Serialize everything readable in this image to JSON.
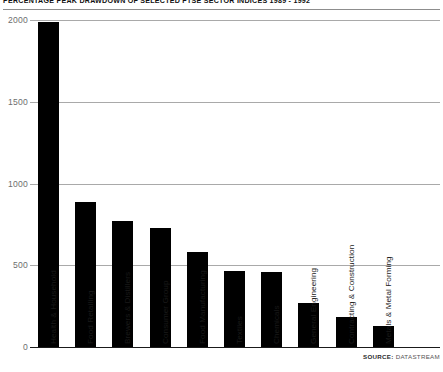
{
  "chart_data": {
    "type": "bar",
    "title": "PERCENTAGE PEAK DRAWDOWN OF SELECTED FTSE SECTOR INDICES 1989 - 1992",
    "xlabel": "",
    "ylabel": "",
    "ylim": [
      0,
      2000
    ],
    "yticks": [
      0,
      500,
      1000,
      1500,
      2000
    ],
    "ytick_labels": [
      "0",
      "500",
      "1000",
      "1500",
      "2000"
    ],
    "grid": true,
    "legend": null,
    "bar_color": "#000000",
    "categories": [
      "Health & Household",
      "Food Retailing",
      "Brewers & Distillers",
      "Consumer Group",
      "Food Manufacturing",
      "Textiles",
      "Chemicals",
      "General Engineering",
      "Contracting & Construction",
      "Metals & Metal Forming"
    ],
    "values": [
      1985,
      890,
      770,
      725,
      580,
      465,
      460,
      268,
      185,
      130
    ]
  },
  "source": {
    "label": "SOURCE:",
    "value": "DATASTREAM"
  }
}
